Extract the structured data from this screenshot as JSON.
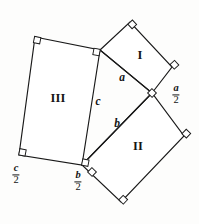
{
  "figure": {
    "background_color": "#fdfdfc",
    "stroke_color": "#191919",
    "fill_color": "#ffffff",
    "regions": [
      {
        "id": "I",
        "label": "I",
        "cx": 140,
        "cy": 55
      },
      {
        "id": "II",
        "label": "II",
        "cx": 138,
        "cy": 146
      },
      {
        "id": "III",
        "label": "III",
        "cx": 58,
        "cy": 98
      }
    ],
    "side_labels": [
      {
        "id": "a",
        "label": "a",
        "cx": 122,
        "cy": 78
      },
      {
        "id": "c",
        "label": "c",
        "cx": 98,
        "cy": 102
      },
      {
        "id": "b",
        "label": "b",
        "cx": 117,
        "cy": 124
      }
    ],
    "fraction_labels": [
      {
        "id": "a-over-2",
        "numerator": "a",
        "denominator": "2",
        "cx": 176,
        "cy": 95
      },
      {
        "id": "b-over-2",
        "numerator": "b",
        "denominator": "2",
        "cx": 78,
        "cy": 182
      },
      {
        "id": "c-over-2",
        "numerator": "c",
        "denominator": "2",
        "cx": 16,
        "cy": 175
      }
    ],
    "polygons": {
      "square_I": "100,50 130,22 172,67 152,93",
      "square_II": "82,165 152,93 184,136 121,202",
      "square_III": "35,37 100,50 82,165 19,155"
    },
    "right_angle_marks": [
      {
        "cx": 35,
        "cy": 37,
        "rot": 11
      },
      {
        "cx": 100,
        "cy": 50,
        "rot": 11
      },
      {
        "cx": 82,
        "cy": 165,
        "rot": 11
      },
      {
        "cx": 19,
        "cy": 155,
        "rot": 11
      },
      {
        "cx": 130,
        "cy": 22,
        "rot": -43
      },
      {
        "cx": 172,
        "cy": 67,
        "rot": 47
      },
      {
        "cx": 152,
        "cy": 93,
        "rot": -46
      },
      {
        "cx": 184,
        "cy": 136,
        "rot": 44
      },
      {
        "cx": 121,
        "cy": 202,
        "rot": 44
      },
      {
        "cx": 92,
        "cy": 172,
        "rot": -46
      }
    ]
  }
}
